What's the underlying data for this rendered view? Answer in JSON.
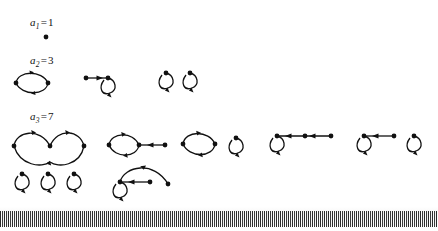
{
  "figure": {
    "rows": [
      {
        "label_symbol": "a",
        "label_subscript": "1",
        "label_equals": "=",
        "label_value": "1",
        "label_full": "a1 = 1",
        "count": 1
      },
      {
        "label_symbol": "a",
        "label_subscript": "2",
        "label_equals": "=",
        "label_value": "3",
        "label_full": "a2 = 3",
        "count": 3
      },
      {
        "label_symbol": "a",
        "label_subscript": "3",
        "label_equals": "=",
        "label_value": "7",
        "label_full": "a3 = 7",
        "count": 7
      }
    ],
    "graphs": [
      {
        "id": "g1-1",
        "name": "single-vertex",
        "nodes": 1,
        "edges": 0,
        "row": 1
      },
      {
        "id": "g2-1",
        "name": "two-vertex-digon",
        "nodes": 2,
        "edges": 2,
        "row": 2
      },
      {
        "id": "g2-2",
        "name": "arrow-into-self-loop",
        "nodes": 2,
        "edges": 2,
        "row": 2
      },
      {
        "id": "g2-3",
        "name": "two-self-loops",
        "nodes": 2,
        "edges": 2,
        "row": 2
      },
      {
        "id": "g3-1",
        "name": "three-vertex-double-arc-cycle",
        "nodes": 3,
        "edges": 3,
        "row": 3
      },
      {
        "id": "g3-2",
        "name": "digon-with-pendant-arrow",
        "nodes": 3,
        "edges": 3,
        "row": 3
      },
      {
        "id": "g3-3",
        "name": "digon-plus-self-loop",
        "nodes": 3,
        "edges": 3,
        "row": 3
      },
      {
        "id": "g3-4",
        "name": "self-loop-with-chain-of-two",
        "nodes": 3,
        "edges": 3,
        "row": 3
      },
      {
        "id": "g3-5",
        "name": "self-loop-pendant-plus-self-loop",
        "nodes": 3,
        "edges": 3,
        "row": 3
      },
      {
        "id": "g3-6",
        "name": "three-self-loops",
        "nodes": 3,
        "edges": 3,
        "row": 3
      },
      {
        "id": "g3-7",
        "name": "self-loop-with-arc-and-pendant",
        "nodes": 3,
        "edges": 3,
        "row": 3
      }
    ],
    "style": {
      "ink_color": "#111111",
      "background_color": "#ffffff",
      "node_radius": 2.2,
      "stroke_width": 1.3
    },
    "scan_artifact": {
      "name": "barcode-strip",
      "present": true
    }
  }
}
